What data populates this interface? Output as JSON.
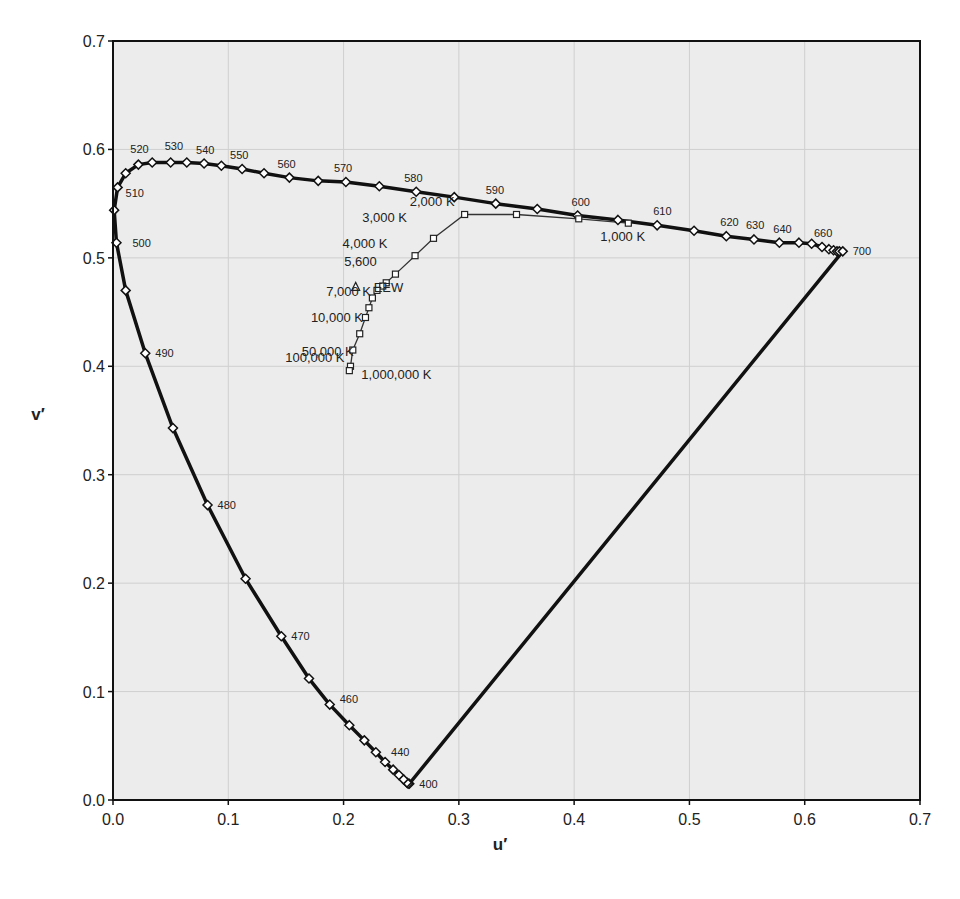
{
  "chart_data": {
    "type": "scatter",
    "title": "",
    "xlabel": "u′",
    "ylabel": "v′",
    "xlim": [
      0.0,
      0.7
    ],
    "ylim": [
      0.0,
      0.7
    ],
    "grid": true,
    "xticks": [
      "0.0",
      "0.1",
      "0.2",
      "0.3",
      "0.4",
      "0.5",
      "0.6",
      "0.7"
    ],
    "yticks": [
      "0.0",
      "0.1",
      "0.2",
      "0.3",
      "0.4",
      "0.5",
      "0.6",
      "0.7"
    ],
    "series": [
      {
        "name": "Spectral locus",
        "marker": "diamond",
        "points": [
          [
            0.257,
            0.015
          ],
          [
            0.256,
            0.015
          ],
          [
            0.255,
            0.016
          ],
          [
            0.252,
            0.019
          ],
          [
            0.248,
            0.023
          ],
          [
            0.243,
            0.028
          ],
          [
            0.236,
            0.035
          ],
          [
            0.228,
            0.044
          ],
          [
            0.218,
            0.055
          ],
          [
            0.205,
            0.069
          ],
          [
            0.188,
            0.088
          ],
          [
            0.17,
            0.112
          ],
          [
            0.146,
            0.151
          ],
          [
            0.115,
            0.204
          ],
          [
            0.082,
            0.272
          ],
          [
            0.052,
            0.343
          ],
          [
            0.028,
            0.412
          ],
          [
            0.011,
            0.47
          ],
          [
            0.003,
            0.514
          ],
          [
            0.001,
            0.544
          ],
          [
            0.004,
            0.565
          ],
          [
            0.011,
            0.578
          ],
          [
            0.022,
            0.586
          ],
          [
            0.034,
            0.588
          ],
          [
            0.05,
            0.588
          ],
          [
            0.064,
            0.588
          ],
          [
            0.079,
            0.587
          ],
          [
            0.094,
            0.585
          ],
          [
            0.112,
            0.582
          ],
          [
            0.131,
            0.578
          ],
          [
            0.153,
            0.574
          ],
          [
            0.178,
            0.571
          ],
          [
            0.202,
            0.57
          ],
          [
            0.231,
            0.566
          ],
          [
            0.263,
            0.561
          ],
          [
            0.296,
            0.556
          ],
          [
            0.332,
            0.55
          ],
          [
            0.368,
            0.545
          ],
          [
            0.403,
            0.539
          ],
          [
            0.438,
            0.535
          ],
          [
            0.472,
            0.53
          ],
          [
            0.504,
            0.525
          ],
          [
            0.532,
            0.52
          ],
          [
            0.556,
            0.517
          ],
          [
            0.578,
            0.514
          ],
          [
            0.595,
            0.514
          ],
          [
            0.606,
            0.513
          ],
          [
            0.615,
            0.51
          ],
          [
            0.621,
            0.508
          ],
          [
            0.625,
            0.507
          ],
          [
            0.628,
            0.506
          ],
          [
            0.63,
            0.506
          ],
          [
            0.633,
            0.506
          ]
        ],
        "labels": [
          {
            "text": "400",
            "u": 0.257,
            "v": 0.015
          },
          {
            "text": "440",
            "u": 0.236,
            "v": 0.035
          },
          {
            "text": "460",
            "u": 0.188,
            "v": 0.088
          },
          {
            "text": "470",
            "u": 0.146,
            "v": 0.151
          },
          {
            "text": "480",
            "u": 0.082,
            "v": 0.272
          },
          {
            "text": "490",
            "u": 0.028,
            "v": 0.412
          },
          {
            "text": "500",
            "u": 0.003,
            "v": 0.514
          },
          {
            "text": "510",
            "u": 0.004,
            "v": 0.565
          },
          {
            "text": "520",
            "u": 0.022,
            "v": 0.586
          },
          {
            "text": "530",
            "u": 0.05,
            "v": 0.588
          },
          {
            "text": "540",
            "u": 0.079,
            "v": 0.587
          },
          {
            "text": "550",
            "u": 0.112,
            "v": 0.582
          },
          {
            "text": "560",
            "u": 0.153,
            "v": 0.574
          },
          {
            "text": "570",
            "u": 0.202,
            "v": 0.57
          },
          {
            "text": "580",
            "u": 0.263,
            "v": 0.561
          },
          {
            "text": "590",
            "u": 0.332,
            "v": 0.55
          },
          {
            "text": "600",
            "u": 0.403,
            "v": 0.539
          },
          {
            "text": "610",
            "u": 0.472,
            "v": 0.53
          },
          {
            "text": "620",
            "u": 0.532,
            "v": 0.52
          },
          {
            "text": "630",
            "u": 0.556,
            "v": 0.517
          },
          {
            "text": "640",
            "u": 0.578,
            "v": 0.514
          },
          {
            "text": "660",
            "u": 0.615,
            "v": 0.51
          },
          {
            "text": "700",
            "u": 0.633,
            "v": 0.506
          }
        ]
      },
      {
        "name": "Black body radiation (Planckian locus)",
        "marker": "square",
        "points": [
          [
            0.447,
            0.532
          ],
          [
            0.404,
            0.536
          ],
          [
            0.35,
            0.54
          ],
          [
            0.305,
            0.54
          ],
          [
            0.278,
            0.518
          ],
          [
            0.262,
            0.502
          ],
          [
            0.245,
            0.485
          ],
          [
            0.237,
            0.477
          ],
          [
            0.234,
            0.474
          ],
          [
            0.229,
            0.47
          ],
          [
            0.225,
            0.463
          ],
          [
            0.222,
            0.454
          ],
          [
            0.219,
            0.445
          ],
          [
            0.214,
            0.43
          ],
          [
            0.208,
            0.415
          ],
          [
            0.206,
            0.4
          ],
          [
            0.205,
            0.396
          ]
        ],
        "labels": [
          {
            "text": "1,000 K",
            "u": 0.447,
            "v": 0.532
          },
          {
            "text": "2,000 K",
            "u": 0.305,
            "v": 0.54
          },
          {
            "text": "3,000 K",
            "u": 0.262,
            "v": 0.52
          },
          {
            "text": "4,000 K",
            "u": 0.245,
            "v": 0.502
          },
          {
            "text": "5,600",
            "u": 0.234,
            "v": 0.485
          },
          {
            "text": "7,000 K",
            "u": 0.229,
            "v": 0.47
          },
          {
            "text": "10,000 K",
            "u": 0.222,
            "v": 0.454
          },
          {
            "text": "50,000 K",
            "u": 0.214,
            "v": 0.43
          },
          {
            "text": "100,000 K",
            "u": 0.206,
            "v": 0.4
          },
          {
            "text": "1,000,000 K",
            "u": 0.205,
            "v": 0.396
          }
        ]
      },
      {
        "name": "EEW",
        "marker": "triangle",
        "points": [
          [
            0.2105,
            0.4737
          ]
        ],
        "labels": [
          {
            "text": "EEW",
            "u": 0.2105,
            "v": 0.4737
          }
        ]
      }
    ]
  }
}
